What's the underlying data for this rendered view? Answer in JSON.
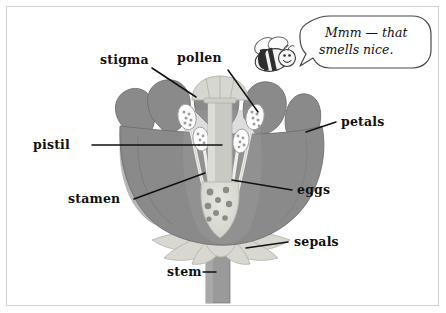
{
  "diagram": {
    "frame_color": "#d2d2d2",
    "background": "#ffffff"
  },
  "colors": {
    "petal": "#8a8a8a",
    "petal_outline": "#6f6f6f",
    "petal_shade": "#7c7c7c",
    "sepal": "#d8d8d0",
    "sepal_outline": "#b6b6ae",
    "stem": "#9a9a9a",
    "stem_outline": "#7d7d7d",
    "style": "#c9c9c4",
    "stigma": "#d7d7d2",
    "anther": "#fbfbfb",
    "anther_outline": "#9b9b9b",
    "pollen_grain": "#9e9e9e",
    "ovary": "#ddddd6",
    "egg": "#8c8c86",
    "filament": "#efefea",
    "leader": "#111111",
    "text": "#111111",
    "bee_body": "#f2f2f2",
    "bee_stripe": "#2e2e2e",
    "bee_wing": "#fcfcfc"
  },
  "labels": [
    {
      "id": "stigma",
      "text": "stigma"
    },
    {
      "id": "pollen",
      "text": "pollen"
    },
    {
      "id": "petals",
      "text": "petals"
    },
    {
      "id": "pistil",
      "text": "pistil"
    },
    {
      "id": "stamen",
      "text": "stamen"
    },
    {
      "id": "eggs",
      "text": "eggs"
    },
    {
      "id": "sepals",
      "text": "sepals"
    },
    {
      "id": "stem",
      "text": "stem"
    }
  ],
  "speech_bubble": {
    "line1": "Mmm — that",
    "line2": "smells nice.",
    "speaker": "bee"
  },
  "bee": {
    "stripe_count": 3,
    "wing_count": 2,
    "expression": "smiling"
  },
  "flower": {
    "petal_lobes": 5,
    "anther_count": 4,
    "egg_count": 8,
    "sepal_count": 7
  }
}
